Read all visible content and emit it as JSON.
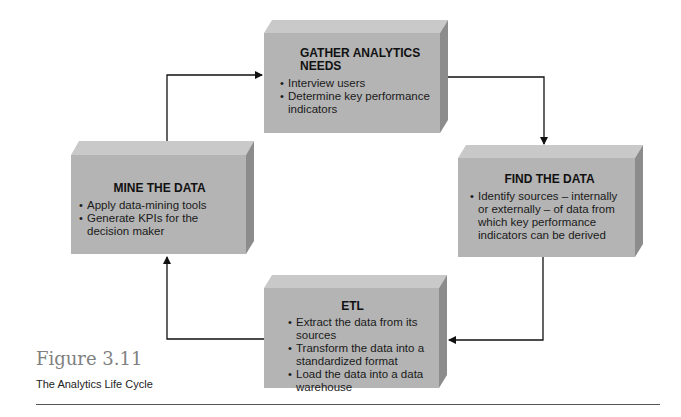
{
  "figure": {
    "label": "Figure 3.11",
    "caption": "The Analytics Life Cycle"
  },
  "steps": [
    {
      "title": "GATHER ANALYTICS NEEDS",
      "title_line1": "GATHER ANALYTICS",
      "title_line2": "NEEDS",
      "bullets": [
        "Interview users",
        "Determine key performance indicators"
      ]
    },
    {
      "title": "FIND THE DATA",
      "bullets": [
        "Identify sources – internally or externally – of data from which key performance indicators can be derived"
      ]
    },
    {
      "title": "ETL",
      "bullets": [
        "Extract the data from its sources",
        "Transform the data into a standardized format",
        "Load the data into a data warehouse"
      ]
    },
    {
      "title": "MINE THE DATA",
      "bullets": [
        "Apply data-mining tools",
        "Generate KPIs for the decision maker"
      ]
    }
  ],
  "flow": [
    {
      "from": "MINE THE DATA",
      "to": "GATHER ANALYTICS NEEDS"
    },
    {
      "from": "GATHER ANALYTICS NEEDS",
      "to": "FIND THE DATA"
    },
    {
      "from": "FIND THE DATA",
      "to": "ETL"
    },
    {
      "from": "ETL",
      "to": "MINE THE DATA"
    }
  ],
  "colors": {
    "box_front": "#b4b4b4",
    "box_top": "#c9c9c9",
    "box_side": "#8c8c8c",
    "arrow": "#111111",
    "figure_label": "#808080"
  }
}
